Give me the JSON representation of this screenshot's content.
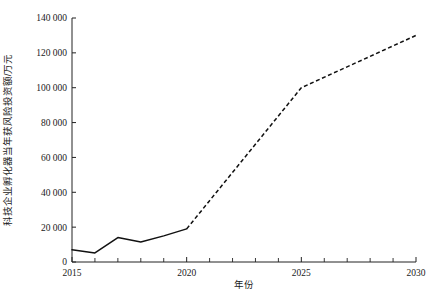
{
  "chart_data": {
    "type": "line",
    "title": "",
    "xlabel": "年份",
    "ylabel": "科技企业孵化器当年获风险投资额/万元",
    "xlim": [
      2015,
      2030
    ],
    "ylim": [
      0,
      140000
    ],
    "grid": false,
    "legend": "none",
    "x_ticks": [
      2015,
      2020,
      2025,
      2030
    ],
    "x_tick_labels": [
      "2015",
      "2020",
      "2025",
      "2030"
    ],
    "x_minor_ticks": [
      2016,
      2017,
      2018,
      2019,
      2021,
      2022,
      2023,
      2024,
      2026,
      2027,
      2028,
      2029
    ],
    "y_ticks": [
      0,
      20000,
      40000,
      60000,
      80000,
      100000,
      120000,
      140000
    ],
    "y_tick_labels": [
      "0",
      "20 000",
      "40 000",
      "60 000",
      "80 000",
      "100 000",
      "120 000",
      "140 000"
    ],
    "series": [
      {
        "name": "历史值",
        "style": "solid",
        "x": [
          2015,
          2016,
          2017,
          2018,
          2019,
          2020
        ],
        "values": [
          7000,
          5200,
          14000,
          11500,
          15000,
          19000
        ]
      },
      {
        "name": "预测值",
        "style": "dashed",
        "x": [
          2020,
          2025,
          2030
        ],
        "values": [
          19000,
          100000,
          130000
        ]
      }
    ],
    "colors": {
      "line": "#111111",
      "axis": "#222222",
      "background": "#ffffff"
    }
  }
}
